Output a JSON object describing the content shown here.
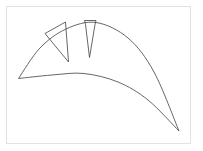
{
  "figure": {
    "title": "",
    "background_color": "#ffffff",
    "frame": {
      "visible": true,
      "color": "#e2e2e2",
      "x": 6,
      "y": 6,
      "width": 185,
      "height": 138
    },
    "stroke_color": "#4b4b4b",
    "stroke_width": 0.85,
    "shapes": [
      {
        "name": "outer-arc",
        "type": "curve",
        "description": "large outer arc sweeping from lower-left vertex up over the top and down to the lower-right tip",
        "points": [
          [
            18.5,
            78.5
          ],
          [
            40.0,
            48.0
          ],
          [
            66.0,
            29.0
          ],
          [
            96.0,
            22.5
          ],
          [
            128.0,
            38.0
          ],
          [
            154.0,
            72.0
          ],
          [
            179.0,
            131.0
          ]
        ]
      },
      {
        "name": "inner-curve",
        "type": "curve",
        "description": "lower inner curve from the same lower-left vertex, bulging gently upward and descending to the same lower-right tip",
        "points": [
          [
            18.5,
            78.5
          ],
          [
            52.0,
            75.0
          ],
          [
            84.0,
            73.5
          ],
          [
            118.0,
            82.0
          ],
          [
            148.0,
            100.0
          ],
          [
            179.0,
            131.0
          ]
        ]
      },
      {
        "name": "left-wedge",
        "type": "polygon",
        "description": "left triangular wedge, apex at top-right, pointing down-right",
        "points": [
          [
            45.0,
            33.5
          ],
          [
            65.5,
            22.0
          ],
          [
            68.5,
            62.0
          ]
        ]
      },
      {
        "name": "right-wedge",
        "type": "polygon",
        "description": "narrow right wedge with a short flat top, tapering to a point below",
        "points": [
          [
            84.5,
            20.5
          ],
          [
            96.0,
            20.5
          ],
          [
            95.0,
            24.5
          ],
          [
            89.5,
            57.5
          ],
          [
            85.5,
            24.5
          ]
        ]
      }
    ]
  }
}
